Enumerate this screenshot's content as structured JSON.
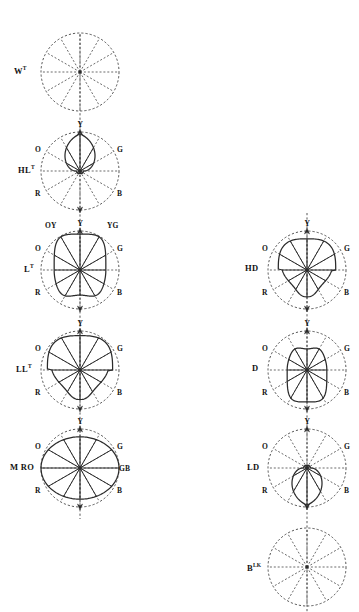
{
  "figure": {
    "background_color": "#ffffff",
    "line_color": "#2b2b2b",
    "grid_style": "dashed",
    "spokes": 12,
    "columns": [
      {
        "name": "left-column",
        "center_x": 80,
        "axis_top": 34,
        "axis_bottom": 519,
        "plots": [
          {
            "id": "wt",
            "label": "W",
            "label_sup": "T",
            "label_x": 14,
            "label_y": 65,
            "cx": 80,
            "cy": 72,
            "r": 39,
            "shape": "none",
            "axis_arrow_top": false,
            "axis_arrow_bottom": false,
            "hue_labels": []
          },
          {
            "id": "hlt",
            "label": "HL",
            "label_sup": "T",
            "label_x": 18,
            "label_y": 164,
            "cx": 80,
            "cy": 171,
            "r": 39,
            "shape": "teardrop-up",
            "shape_extent": 0.95,
            "shape_width": 0.3,
            "axis_arrow_top": true,
            "axis_arrow_bottom": true,
            "hue_labels": [
              {
                "text": "Y",
                "dx": 0,
                "dy": -47,
                "anchor": "center"
              },
              {
                "text": "O",
                "dx": -36,
                "dy": -22,
                "anchor": "right"
              },
              {
                "text": "G",
                "dx": 36,
                "dy": -22,
                "anchor": "left"
              },
              {
                "text": "R",
                "dx": -36,
                "dy": 22,
                "anchor": "right"
              },
              {
                "text": "B",
                "dx": 36,
                "dy": 22,
                "anchor": "left"
              }
            ]
          },
          {
            "id": "lt",
            "label": "L",
            "label_sup": "T",
            "label_x": 24,
            "label_y": 263,
            "cx": 80,
            "cy": 270,
            "r": 39,
            "shape": "rounded-square-up",
            "shape_extent": 0.92,
            "shape_width": 0.72,
            "axis_arrow_top": true,
            "axis_arrow_bottom": true,
            "hue_labels": [
              {
                "text": "Y",
                "dx": 0,
                "dy": -47,
                "anchor": "center"
              },
              {
                "text": "OY",
                "dx": -26,
                "dy": -45,
                "anchor": "right"
              },
              {
                "text": "YG",
                "dx": 26,
                "dy": -45,
                "anchor": "left"
              },
              {
                "text": "O",
                "dx": -36,
                "dy": -22,
                "anchor": "right"
              },
              {
                "text": "G",
                "dx": 36,
                "dy": -22,
                "anchor": "left"
              },
              {
                "text": "R",
                "dx": -36,
                "dy": 22,
                "anchor": "right"
              },
              {
                "text": "B",
                "dx": 36,
                "dy": 22,
                "anchor": "left"
              }
            ]
          },
          {
            "id": "llt",
            "label": "LL",
            "label_sup": "T",
            "label_x": 16,
            "label_y": 363,
            "cx": 80,
            "cy": 370,
            "r": 39,
            "shape": "lobed-upper",
            "shape_extent": 0.88,
            "shape_width": 0.95,
            "axis_arrow_top": true,
            "axis_arrow_bottom": true,
            "hue_labels": [
              {
                "text": "Y",
                "dx": 0,
                "dy": -47,
                "anchor": "center"
              },
              {
                "text": "O",
                "dx": -36,
                "dy": -22,
                "anchor": "right"
              },
              {
                "text": "G",
                "dx": 36,
                "dy": -22,
                "anchor": "left"
              },
              {
                "text": "R",
                "dx": -36,
                "dy": 22,
                "anchor": "right"
              },
              {
                "text": "B",
                "dx": 36,
                "dy": 22,
                "anchor": "left"
              }
            ]
          },
          {
            "id": "mro",
            "label": "M RO",
            "label_sup": "",
            "label_x": 10,
            "label_y": 462,
            "cx": 80,
            "cy": 468,
            "r": 39,
            "shape": "ellipse-wide",
            "shape_extent": 1.0,
            "shape_width": 1.0,
            "axis_arrow_top": true,
            "axis_arrow_bottom": true,
            "hue_labels": [
              {
                "text": "Y",
                "dx": 0,
                "dy": -47,
                "anchor": "center"
              },
              {
                "text": "O",
                "dx": -36,
                "dy": -22,
                "anchor": "right"
              },
              {
                "text": "G",
                "dx": 36,
                "dy": -22,
                "anchor": "left"
              },
              {
                "text": "R",
                "dx": -36,
                "dy": 22,
                "anchor": "right"
              },
              {
                "text": "B",
                "dx": 36,
                "dy": 22,
                "anchor": "left"
              },
              {
                "text": "GB",
                "dx": 38,
                "dy": 0,
                "anchor": "left"
              }
            ]
          }
        ]
      },
      {
        "name": "right-column",
        "center_x": 307,
        "axis_top": 213,
        "axis_bottom": 612,
        "plots": [
          {
            "id": "hd",
            "label": "HD",
            "label_sup": "",
            "label_x": 245,
            "label_y": 263,
            "cx": 307,
            "cy": 270,
            "r": 39,
            "shape": "lobed-upper",
            "shape_extent": 0.8,
            "shape_width": 0.92,
            "axis_arrow_top": true,
            "axis_arrow_bottom": true,
            "hue_labels": [
              {
                "text": "Y",
                "dx": 0,
                "dy": -47,
                "anchor": "center"
              },
              {
                "text": "O",
                "dx": -36,
                "dy": -22,
                "anchor": "right"
              },
              {
                "text": "G",
                "dx": 36,
                "dy": -22,
                "anchor": "left"
              },
              {
                "text": "R",
                "dx": -36,
                "dy": 22,
                "anchor": "right"
              },
              {
                "text": "B",
                "dx": 36,
                "dy": 22,
                "anchor": "left"
              }
            ]
          },
          {
            "id": "d",
            "label": "D",
            "label_sup": "",
            "label_x": 252,
            "label_y": 363,
            "cx": 307,
            "cy": 370,
            "r": 39,
            "shape": "rounded-square-down",
            "shape_extent": 0.82,
            "shape_width": 0.62,
            "axis_arrow_top": true,
            "axis_arrow_bottom": true,
            "hue_labels": [
              {
                "text": "Y",
                "dx": 0,
                "dy": -47,
                "anchor": "center"
              },
              {
                "text": "O",
                "dx": -36,
                "dy": -22,
                "anchor": "right"
              },
              {
                "text": "G",
                "dx": 36,
                "dy": -22,
                "anchor": "left"
              },
              {
                "text": "R",
                "dx": -36,
                "dy": 22,
                "anchor": "right"
              },
              {
                "text": "B",
                "dx": 36,
                "dy": 22,
                "anchor": "left"
              }
            ]
          },
          {
            "id": "ld",
            "label": "LD",
            "label_sup": "",
            "label_x": 247,
            "label_y": 462,
            "cx": 307,
            "cy": 468,
            "r": 39,
            "shape": "teardrop-down",
            "shape_extent": 0.95,
            "shape_width": 0.3,
            "axis_arrow_top": true,
            "axis_arrow_bottom": true,
            "hue_labels": [
              {
                "text": "Y",
                "dx": 0,
                "dy": -47,
                "anchor": "center"
              },
              {
                "text": "O",
                "dx": -36,
                "dy": -22,
                "anchor": "right"
              },
              {
                "text": "G",
                "dx": 36,
                "dy": -22,
                "anchor": "left"
              },
              {
                "text": "R",
                "dx": -36,
                "dy": 22,
                "anchor": "right"
              },
              {
                "text": "B",
                "dx": 36,
                "dy": 22,
                "anchor": "left"
              }
            ]
          },
          {
            "id": "blk",
            "label": "B",
            "label_sup": "LK",
            "label_x": 247,
            "label_y": 562,
            "cx": 307,
            "cy": 567,
            "r": 39,
            "shape": "none",
            "axis_arrow_top": false,
            "axis_arrow_bottom": false,
            "hue_labels": []
          }
        ]
      }
    ]
  }
}
